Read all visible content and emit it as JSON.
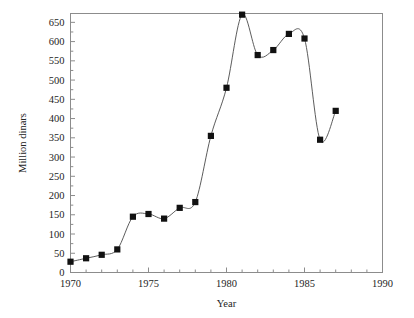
{
  "chart_data": {
    "type": "line",
    "title": "",
    "xlabel": "Year",
    "ylabel": "Million dinars",
    "xlim": [
      1970,
      1990
    ],
    "ylim": [
      0,
      673
    ],
    "grid": false,
    "legend": null,
    "marker": "filled-square",
    "line_color": "#4a4a4a",
    "marker_color": "#111111",
    "frame_color": "#8c8c8c",
    "xticks": [
      1970,
      1975,
      1980,
      1985,
      1990
    ],
    "xtick_labels": [
      "1970",
      "1975",
      "1980",
      "1985",
      "1990"
    ],
    "xminor_step": 1,
    "yticks": [
      0,
      50,
      100,
      150,
      200,
      250,
      300,
      350,
      400,
      450,
      500,
      550,
      600,
      650
    ],
    "ytick_labels": [
      "0",
      "50",
      "100",
      "150",
      "200",
      "250",
      "300",
      "350",
      "400",
      "450",
      "500",
      "550",
      "600",
      "650"
    ],
    "yminor_step": 25,
    "x": [
      1970,
      1971,
      1972,
      1973,
      1974,
      1975,
      1976,
      1977,
      1978,
      1979,
      1980,
      1981,
      1982,
      1983,
      1984,
      1985,
      1986,
      1987
    ],
    "values": [
      28,
      37,
      46,
      60,
      145,
      152,
      140,
      168,
      183,
      355,
      480,
      670,
      565,
      578,
      620,
      608,
      345,
      420
    ]
  }
}
